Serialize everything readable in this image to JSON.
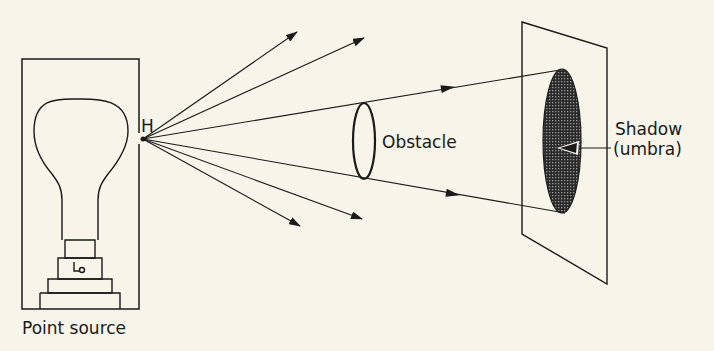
{
  "diagram": {
    "labels": {
      "source_point": "H",
      "point_source": "Point source",
      "obstacle": "Obstacle",
      "shadow_line1": "Shadow",
      "shadow_line2": "(umbra)"
    },
    "colors": {
      "background": "#f7f4e9",
      "ink": "#1a1a1a",
      "shadow_fill": "#3a3a3a"
    }
  }
}
